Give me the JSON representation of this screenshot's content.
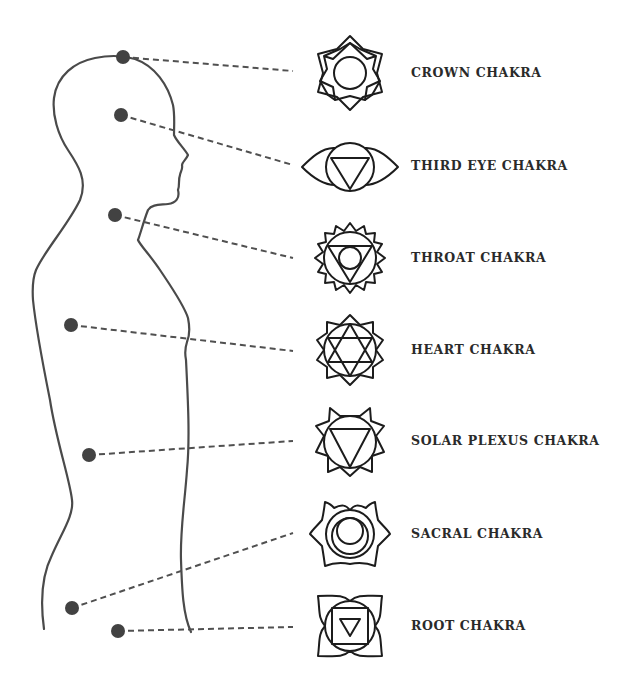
{
  "diagram": {
    "type": "chakra-body-map",
    "figure": "human-profile-silhouette",
    "colors": {
      "figure_stroke": "#4a4a4a",
      "dot_fill": "#424242",
      "leader_line": "#505050",
      "symbol_stroke": "#1c1c1c",
      "label_text": "#2a2a2a",
      "background": "#ffffff"
    },
    "chakras": [
      {
        "label": "CROWN CHAKRA",
        "icon": "crown-chakra-icon",
        "dot": [
          123,
          57
        ],
        "label_y": 74
      },
      {
        "label": "THIRD EYE CHAKRA",
        "icon": "third-eye-chakra-icon",
        "dot": [
          121,
          115
        ],
        "label_y": 167
      },
      {
        "label": "THROAT CHAKRA",
        "icon": "throat-chakra-icon",
        "dot": [
          115,
          215
        ],
        "label_y": 259
      },
      {
        "label": "HEART CHAKRA",
        "icon": "heart-chakra-icon",
        "dot": [
          71,
          325
        ],
        "label_y": 351
      },
      {
        "label": "SOLAR PLEXUS CHAKRA",
        "icon": "solar-plexus-chakra-icon",
        "dot": [
          89,
          455
        ],
        "label_y": 442
      },
      {
        "label": "SACRAL CHAKRA",
        "icon": "sacral-chakra-icon",
        "dot": [
          72,
          608
        ],
        "label_y": 535
      },
      {
        "label": "ROOT CHAKRA",
        "icon": "root-chakra-icon",
        "dot": [
          118,
          631
        ],
        "label_y": 627
      }
    ]
  }
}
